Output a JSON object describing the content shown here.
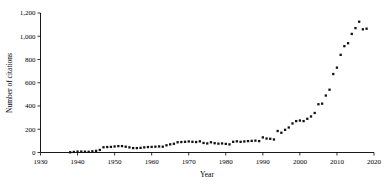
{
  "chart_data": {
    "type": "scatter",
    "title": "",
    "xlabel": "Year",
    "ylabel": "Number of citations",
    "xlim": [
      1930,
      2020
    ],
    "ylim": [
      0,
      1200
    ],
    "xticks": [
      1930,
      1940,
      1950,
      1960,
      1970,
      1980,
      1990,
      2000,
      2010,
      2020
    ],
    "xtick_labels": [
      "1930",
      "1940",
      "1950",
      "1960",
      "1970",
      "1980",
      "1990",
      "2000",
      "2010",
      "2020"
    ],
    "yticks": [
      0,
      200,
      400,
      600,
      800,
      1000,
      1200
    ],
    "ytick_labels": [
      "0",
      "200",
      "400",
      "600",
      "800",
      "1,000",
      "1,200"
    ],
    "grid": false,
    "legend": null,
    "marker": "square",
    "marker_color": "#111111",
    "x": [
      1938,
      1939,
      1940,
      1941,
      1942,
      1943,
      1944,
      1945,
      1946,
      1947,
      1948,
      1949,
      1950,
      1951,
      1952,
      1953,
      1954,
      1955,
      1956,
      1957,
      1958,
      1959,
      1960,
      1961,
      1962,
      1963,
      1964,
      1965,
      1966,
      1967,
      1968,
      1969,
      1970,
      1971,
      1972,
      1973,
      1974,
      1975,
      1976,
      1977,
      1978,
      1979,
      1980,
      1981,
      1982,
      1983,
      1984,
      1985,
      1986,
      1987,
      1988,
      1989,
      1990,
      1991,
      1992,
      1993,
      1994,
      1995,
      1996,
      1997,
      1998,
      1999,
      2000,
      2001,
      2002,
      2003,
      2004,
      2005,
      2006,
      2007,
      2008,
      2009,
      2010,
      2011,
      2012,
      2013,
      2014,
      2015,
      2016,
      2017,
      2018
    ],
    "y": [
      2,
      5,
      8,
      8,
      7,
      6,
      10,
      14,
      22,
      45,
      47,
      48,
      52,
      55,
      55,
      50,
      44,
      38,
      38,
      40,
      44,
      47,
      48,
      50,
      52,
      50,
      62,
      70,
      75,
      88,
      90,
      92,
      95,
      92,
      90,
      96,
      82,
      78,
      88,
      80,
      76,
      78,
      74,
      70,
      92,
      96,
      92,
      95,
      98,
      100,
      102,
      98,
      130,
      120,
      118,
      112,
      185,
      170,
      195,
      215,
      250,
      270,
      275,
      270,
      290,
      310,
      340,
      415,
      420,
      490,
      540,
      675,
      730,
      840,
      915,
      940,
      1020,
      1070,
      1125,
      1060,
      1065
    ],
    "series_label": "Citations per year"
  },
  "axes": {
    "y_axis_title": "Number of citations",
    "x_axis_title": "Year"
  }
}
